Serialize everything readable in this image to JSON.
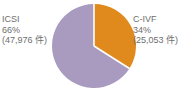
{
  "chart_data": {
    "type": "pie",
    "title": "",
    "xlabel": "",
    "ylabel": "",
    "legend_position": "outside-labels",
    "grid": false,
    "start_angle_deg": 0,
    "direction": "clockwise",
    "categories": [
      "C-IVF",
      "ICSI"
    ],
    "values": [
      34,
      66
    ],
    "counts": [
      25053,
      47976
    ],
    "unit_suffix": "件",
    "colors": [
      "#e08a1e",
      "#a99bbf"
    ],
    "slices": [
      {
        "name": "C-IVF",
        "percent": 34,
        "count": 25053,
        "color": "#e08a1e",
        "label_lines": [
          "C-IVF",
          "34%",
          "(25,053 件)"
        ]
      },
      {
        "name": "ICSI",
        "percent": 66,
        "count": 47976,
        "color": "#a99bbf",
        "label_lines": [
          "ICSI",
          "66%",
          "(47,976 件)"
        ]
      }
    ]
  },
  "labels": {
    "left": {
      "name": "ICSI",
      "percent": "66%",
      "count": "(47,976 件)"
    },
    "right": {
      "name": "C-IVF",
      "percent": "34%",
      "count": "(25,053 件)"
    }
  },
  "style": {
    "text_color": "#6e6e6e",
    "background": "#ffffff",
    "slice_gap_color": "#ffffff"
  }
}
